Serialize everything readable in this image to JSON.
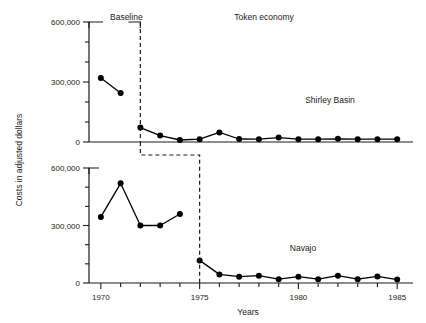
{
  "chart_data": {
    "type": "line",
    "title": "",
    "xlabel": "Years",
    "ylabel": "Costs in adjusted dollars",
    "xlim": [
      1969.4,
      1985.8
    ],
    "xticks": [
      1970,
      1971,
      1972,
      1973,
      1974,
      1975,
      1976,
      1977,
      1978,
      1979,
      1980,
      1981,
      1982,
      1983,
      1984,
      1985
    ],
    "xticklabels": [
      "1970",
      "",
      "",
      "",
      "",
      "1975",
      "",
      "",
      "",
      "",
      "1980",
      "",
      "",
      "",
      "",
      "1985"
    ],
    "grid": false,
    "legend": "none",
    "panels": [
      {
        "name": "Shirley Basin",
        "label": "Shirley Basin",
        "ylim": [
          0,
          600000
        ],
        "yticks": [
          0,
          100000,
          200000,
          300000,
          400000,
          500000,
          600000
        ],
        "yticklabels": [
          "0",
          "",
          "",
          "300,000",
          "",
          "",
          "600,000"
        ],
        "phase_line_x": 1972,
        "phases": [
          {
            "label": "Baseline",
            "start": 1970,
            "end": 1972
          },
          {
            "label": "Token economy",
            "start": 1972,
            "end": 1985
          }
        ],
        "series": [
          {
            "name": "Shirley Basin costs",
            "x": [
              1970,
              1971
            ],
            "values": [
              320000,
              245000
            ],
            "phase": "Baseline"
          },
          {
            "name": "Shirley Basin costs",
            "x": [
              1972,
              1973,
              1974,
              1975,
              1976,
              1977,
              1978,
              1979,
              1980,
              1981,
              1982,
              1983,
              1984,
              1985
            ],
            "values": [
              72000,
              32000,
              10000,
              14000,
              48000,
              15000,
              14000,
              22000,
              14000,
              14000,
              16000,
              14000,
              14000,
              14000
            ],
            "phase": "Token economy"
          }
        ]
      },
      {
        "name": "Navajo",
        "label": "Navajo",
        "ylim": [
          0,
          600000
        ],
        "yticks": [
          0,
          100000,
          200000,
          300000,
          400000,
          500000,
          600000
        ],
        "yticklabels": [
          "0",
          "",
          "",
          "300,000",
          "",
          "",
          "600,000"
        ],
        "phase_line_x": 1975,
        "phases": [
          {
            "label": "Baseline",
            "start": 1970,
            "end": 1975
          },
          {
            "label": "Token economy",
            "start": 1975,
            "end": 1985
          }
        ],
        "series": [
          {
            "name": "Navajo costs",
            "x": [
              1970,
              1971,
              1972,
              1973,
              1974
            ],
            "values": [
              345000,
              520000,
              300000,
              300000,
              360000
            ],
            "phase": "Baseline"
          },
          {
            "name": "Navajo costs",
            "x": [
              1975,
              1976,
              1977,
              1978,
              1979,
              1980,
              1981,
              1982,
              1983,
              1984,
              1985
            ],
            "values": [
              118000,
              45000,
              33000,
              38000,
              20000,
              33000,
              20000,
              38000,
              20000,
              34000,
              18000
            ],
            "phase": "Token economy"
          }
        ]
      }
    ],
    "annotations": [
      {
        "name": "baseline-bracket-label",
        "text": "Baseline"
      },
      {
        "name": "token-economy-label",
        "text": "Token economy"
      },
      {
        "name": "shirley-basin-label",
        "text": "Shirley Basin"
      },
      {
        "name": "navajo-label",
        "text": "Navajo"
      }
    ],
    "colors": {
      "line": "#000000",
      "marker": "#000000",
      "axis": "#1a1a1a",
      "phase_line": "#1a1a1a",
      "background": "#ffffff"
    }
  }
}
